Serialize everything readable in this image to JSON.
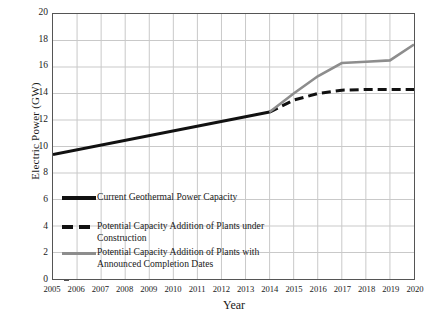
{
  "chart_data": {
    "type": "line",
    "title": "",
    "xlabel": "Year",
    "ylabel": "Electric Power (GW)",
    "xlim": [
      2005,
      2020
    ],
    "ylim": [
      0,
      20
    ],
    "ytick_step": 2,
    "grid": true,
    "legend_position": "lower-left-inside",
    "categories": [
      2005,
      2006,
      2007,
      2008,
      2009,
      2010,
      2011,
      2012,
      2013,
      2014,
      2015,
      2016,
      2017,
      2018,
      2019,
      2020
    ],
    "yticks": [
      0,
      2,
      4,
      6,
      8,
      10,
      12,
      14,
      16,
      18,
      20
    ],
    "xticks": [
      "2005",
      "2006",
      "2007",
      "2008",
      "2009",
      "2010",
      "2011",
      "2012",
      "2013",
      "2014",
      "2015",
      "2016",
      "2017",
      "2018",
      "2019",
      "2020"
    ],
    "series": [
      {
        "name": "Current Geothermal Power Capacity",
        "style": "solid",
        "color": "#111111",
        "width": 3.0,
        "x": [
          2005,
          2014
        ],
        "values": [
          9.4,
          12.6
        ]
      },
      {
        "name": "Potential Capacity Addition of Plants under Construction",
        "style": "dashed",
        "color": "#111111",
        "width": 3.0,
        "x": [
          2014,
          2015,
          2016,
          2017,
          2018,
          2019,
          2020
        ],
        "values": [
          12.6,
          13.5,
          14.0,
          14.25,
          14.3,
          14.3,
          14.3
        ]
      },
      {
        "name": "Potential Capacity Addition of Plants with Announced Completion Dates",
        "style": "solid",
        "color": "#8d8d8d",
        "width": 2.6,
        "x": [
          2014,
          2015,
          2016,
          2017,
          2018,
          2019,
          2020
        ],
        "values": [
          12.6,
          14.0,
          15.3,
          16.3,
          16.4,
          16.5,
          17.7
        ]
      }
    ]
  },
  "legend": {
    "items": [
      {
        "label": "Current Geothermal Power Capacity",
        "swatch": "solid-black-line-icon"
      },
      {
        "label": "Potential Capacity Addition of Plants under\nConstruction",
        "swatch": "dashed-black-line-icon"
      },
      {
        "label": "Potential Capacity Addition of Plants with\nAnnounced Completion Dates",
        "swatch": "solid-gray-line-icon"
      }
    ]
  },
  "colors": {
    "current": "#111111",
    "under_construction": "#111111",
    "announced": "#8d8d8d",
    "grid": "#c9c9c9",
    "frame": "#555555",
    "background": "#ffffff"
  }
}
